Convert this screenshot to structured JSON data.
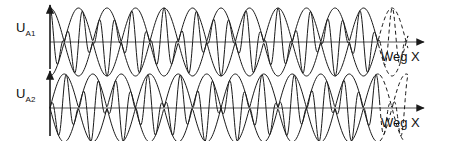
{
  "figure": {
    "type": "waveform-diagram",
    "background": "#ffffff",
    "stroke_color": "#1a1a1a",
    "baseline_color": "#808080",
    "width": 450,
    "height": 141
  },
  "traces": [
    {
      "id": "trace-1",
      "y_label": "U",
      "y_label_sub": "A1",
      "x_label": "Weg X",
      "baseline_y": 42,
      "axis_x": 50,
      "amplitude": 34,
      "envelope_lobes": 6.5,
      "envelope_phase": "antinode-at-origin",
      "carrier_cycles_per_lobe": 3.5,
      "dashed_tail_lobes": 0.5
    },
    {
      "id": "trace-2",
      "y_label": "U",
      "y_label_sub": "A2",
      "x_label": "Weg X",
      "baseline_y": 108,
      "axis_x": 50,
      "amplitude": 34,
      "envelope_lobes": 6.0,
      "envelope_phase": "node-at-origin",
      "carrier_cycles_per_lobe": 3.5,
      "dashed_tail_lobes": 0.5
    }
  ],
  "chart_data": {
    "type": "line",
    "title": "",
    "xlabel": "Weg X",
    "ylabel": "U_A1 / U_A2",
    "grid": false,
    "legend": "none",
    "series": [
      {
        "name": "U_A1",
        "description": "carrier modulated by cosine envelope, antinode at origin",
        "envelope_period_px": 57,
        "carrier_period_px": 16.3,
        "amplitude_px": 34,
        "x_start": 50,
        "x_solid_end": 380,
        "x_dashed_end": 408
      },
      {
        "name": "U_A2",
        "description": "carrier modulated by sine envelope, node at origin",
        "envelope_period_px": 57,
        "carrier_period_px": 16.3,
        "amplitude_px": 34,
        "x_start": 50,
        "x_solid_end": 380,
        "x_dashed_end": 408
      }
    ]
  }
}
